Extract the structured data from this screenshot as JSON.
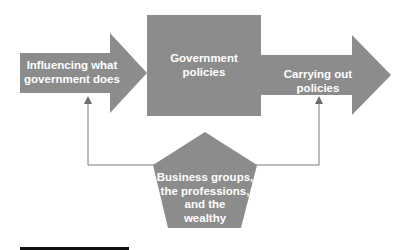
{
  "diagram": {
    "nodes": {
      "influencing": {
        "label_line1": "Influencing what",
        "label_line2": "government does",
        "shape": "right-arrow"
      },
      "policies": {
        "label_line1": "Government",
        "label_line2": "policies",
        "shape": "square"
      },
      "carrying": {
        "label": "Carrying out policies",
        "shape": "right-arrow"
      },
      "groups": {
        "label_line1": "Business groups,",
        "label_line2": "the professions,",
        "label_line3": "and the",
        "label_line4": "wealthy",
        "shape": "pentagon"
      }
    },
    "edges": [
      {
        "from": "influencing",
        "to": "policies",
        "type": "arrow-shape"
      },
      {
        "from": "policies",
        "to": "carrying",
        "type": "arrow-shape"
      },
      {
        "from": "groups",
        "to": "influencing",
        "type": "line-arrow"
      },
      {
        "from": "groups",
        "to": "carrying",
        "type": "line-arrow"
      }
    ],
    "colors": {
      "shape_fill": "#8c8c8c",
      "connector": "#6e6e6e",
      "text": "#ffffff",
      "rule": "#111111"
    }
  }
}
